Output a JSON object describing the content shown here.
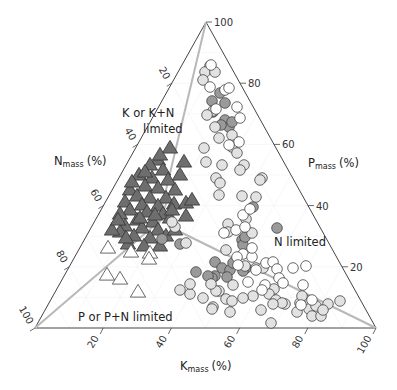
{
  "chart_data": {
    "type": "scatter",
    "subtype": "ternary",
    "title": "",
    "axes": {
      "N": {
        "label": "N",
        "subscript": "mass",
        "unit": "(%)",
        "ticks": [
          20,
          40,
          60,
          80,
          100
        ]
      },
      "P": {
        "label": "P",
        "subscript": "mass",
        "unit": "(%)",
        "ticks": [
          20,
          40,
          60,
          80,
          100
        ]
      },
      "K": {
        "label": "K",
        "subscript": "mass",
        "unit": "(%)",
        "ticks": [
          20,
          40,
          60,
          80,
          100
        ]
      }
    },
    "vertices_px": {
      "top": [
        206,
        22
      ],
      "left": [
        35,
        328
      ],
      "right": [
        376,
        328
      ]
    },
    "region_labels": [
      {
        "text_line1": "K or K+N",
        "text_line2": "limited"
      },
      {
        "text_line1": "N limited"
      },
      {
        "text_line1": "P or P+N limited"
      }
    ],
    "boundary_lines_px": [
      {
        "from": [
          206,
          22
        ],
        "to": [
          156,
          232
        ]
      },
      {
        "from": [
          35,
          328
        ],
        "to": [
          170,
          212
        ]
      },
      {
        "from": [
          376,
          328
        ],
        "to": [
          168,
          226
        ]
      },
      {
        "from": [
          156,
          232
        ],
        "to": [
          178,
          170
        ]
      }
    ],
    "series": [
      {
        "name": "K or K+N limited (dark triangles)",
        "marker": "triangle",
        "fill": "#6e6e6e",
        "stroke": "#333333",
        "points_px": [
          [
            170,
            148
          ],
          [
            184,
            162
          ],
          [
            158,
            160
          ],
          [
            150,
            165
          ],
          [
            163,
            170
          ],
          [
            139,
            175
          ],
          [
            152,
            178
          ],
          [
            168,
            180
          ],
          [
            145,
            186
          ],
          [
            130,
            190
          ],
          [
            158,
            188
          ],
          [
            175,
            190
          ],
          [
            137,
            196
          ],
          [
            150,
            198
          ],
          [
            166,
            198
          ],
          [
            125,
            202
          ],
          [
            142,
            205
          ],
          [
            158,
            206
          ],
          [
            174,
            204
          ],
          [
            186,
            203
          ],
          [
            130,
            210
          ],
          [
            147,
            212
          ],
          [
            163,
            214
          ],
          [
            120,
            214
          ],
          [
            137,
            220
          ],
          [
            153,
            222
          ],
          [
            170,
            218
          ],
          [
            186,
            216
          ],
          [
            125,
            226
          ],
          [
            142,
            228
          ],
          [
            158,
            230
          ],
          [
            120,
            232
          ],
          [
            134,
            236
          ],
          [
            150,
            238
          ],
          [
            166,
            236
          ],
          [
            128,
            244
          ],
          [
            144,
            246
          ],
          [
            160,
            246
          ],
          [
            175,
            230
          ],
          [
            112,
            230
          ],
          [
            118,
            220
          ],
          [
            132,
            182
          ],
          [
            160,
            155
          ],
          [
            145,
            172
          ],
          [
            180,
            175
          ],
          [
            192,
            200
          ],
          [
            172,
            210
          ],
          [
            126,
            238
          ],
          [
            155,
            215
          ],
          [
            140,
            218
          ]
        ]
      },
      {
        "name": "P or P+N limited (open triangles)",
        "marker": "triangle",
        "fill": "#ffffff",
        "stroke": "#444444",
        "points_px": [
          [
            108,
            248
          ],
          [
            131,
            252
          ],
          [
            150,
            253
          ],
          [
            149,
            259
          ],
          [
            107,
            275
          ],
          [
            120,
            279
          ],
          [
            138,
            292
          ]
        ]
      },
      {
        "name": "N limited (dark grey circles)",
        "marker": "circle",
        "fill": "#9a9a9a",
        "stroke": "#444444",
        "points_px": [
          [
            220,
            93
          ],
          [
            212,
            101
          ],
          [
            225,
            103
          ],
          [
            213,
            112
          ],
          [
            225,
            120
          ],
          [
            229,
            127
          ],
          [
            221,
            125
          ],
          [
            232,
            122
          ],
          [
            253,
            207
          ],
          [
            277,
            228
          ],
          [
            242,
            240
          ],
          [
            243,
            245
          ],
          [
            245,
            237
          ],
          [
            215,
            262
          ],
          [
            222,
            268
          ],
          [
            215,
            276
          ],
          [
            212,
            278
          ],
          [
            230,
            270
          ],
          [
            233,
            263
          ],
          [
            246,
            268
          ],
          [
            243,
            271
          ],
          [
            196,
            272
          ],
          [
            162,
            239
          ],
          [
            180,
            244
          ],
          [
            208,
            276
          ],
          [
            227,
            277
          ]
        ]
      },
      {
        "name": "light grey circles",
        "marker": "circle",
        "fill": "#e2e2e2",
        "stroke": "#444444",
        "points_px": [
          [
            210,
            66
          ],
          [
            205,
            72
          ],
          [
            203,
            80
          ],
          [
            215,
            72
          ],
          [
            213,
            111
          ],
          [
            207,
            115
          ],
          [
            215,
            127
          ],
          [
            232,
            135
          ],
          [
            219,
            138
          ],
          [
            204,
            148
          ],
          [
            232,
            147
          ],
          [
            237,
            153
          ],
          [
            206,
            162
          ],
          [
            244,
            165
          ],
          [
            240,
            170
          ],
          [
            262,
            178
          ],
          [
            260,
            180
          ],
          [
            222,
            165
          ],
          [
            216,
            178
          ],
          [
            220,
            183
          ],
          [
            219,
            195
          ],
          [
            242,
            196
          ],
          [
            256,
            197
          ],
          [
            228,
            224
          ],
          [
            246,
            219
          ],
          [
            228,
            232
          ],
          [
            252,
            233
          ],
          [
            256,
            268
          ],
          [
            263,
            268
          ],
          [
            274,
            289
          ],
          [
            269,
            294
          ],
          [
            276,
            300
          ],
          [
            297,
            312
          ],
          [
            285,
            304
          ],
          [
            271,
            323
          ],
          [
            305,
            300
          ],
          [
            300,
            303
          ],
          [
            309,
            309
          ],
          [
            328,
            304
          ],
          [
            316,
            306
          ],
          [
            302,
            296
          ],
          [
            282,
            303
          ],
          [
            253,
            296
          ],
          [
            261,
            310
          ],
          [
            273,
            304
          ],
          [
            219,
            291
          ],
          [
            226,
            299
          ],
          [
            232,
            301
          ],
          [
            190,
            294
          ],
          [
            216,
            291
          ],
          [
            203,
            298
          ],
          [
            213,
            307
          ],
          [
            230,
            312
          ],
          [
            211,
            284
          ],
          [
            340,
            301
          ],
          [
            312,
            316
          ],
          [
            321,
            316
          ],
          [
            323,
            310
          ],
          [
            226,
            250
          ],
          [
            212,
            309
          ],
          [
            233,
            285
          ],
          [
            243,
            298
          ],
          [
            186,
            243
          ],
          [
            175,
            227
          ],
          [
            172,
            222
          ],
          [
            245,
            266
          ],
          [
            190,
            284
          ],
          [
            180,
            290
          ]
        ]
      },
      {
        "name": "open circles",
        "marker": "circle",
        "fill": "#ffffff",
        "stroke": "#444444",
        "points_px": [
          [
            211,
            65
          ],
          [
            225,
            90
          ],
          [
            229,
            88
          ],
          [
            240,
            118
          ],
          [
            210,
            87
          ],
          [
            216,
            109
          ],
          [
            237,
            107
          ],
          [
            239,
            142
          ],
          [
            229,
            145
          ],
          [
            243,
            215
          ],
          [
            236,
            230
          ],
          [
            245,
            227
          ],
          [
            243,
            254
          ],
          [
            252,
            257
          ],
          [
            237,
            257
          ],
          [
            238,
            265
          ],
          [
            266,
            263
          ],
          [
            273,
            262
          ],
          [
            277,
            269
          ],
          [
            265,
            285
          ],
          [
            279,
            278
          ],
          [
            283,
            283
          ],
          [
            293,
            268
          ],
          [
            306,
            266
          ],
          [
            303,
            285
          ],
          [
            262,
            290
          ],
          [
            301,
            305
          ],
          [
            256,
            270
          ],
          [
            248,
            282
          ],
          [
            312,
            300
          ],
          [
            224,
            233
          ],
          [
            252,
            248
          ],
          [
            250,
            209
          ]
        ]
      }
    ]
  }
}
